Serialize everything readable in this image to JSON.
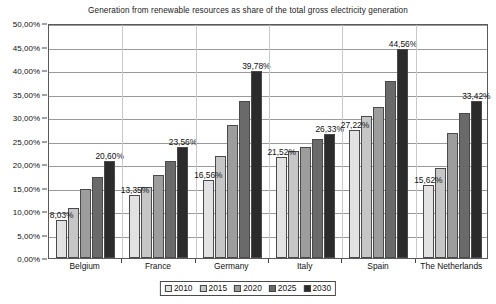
{
  "chart_data": {
    "type": "bar",
    "title": "Generation from renewable resources as share of the total gross electricity generation",
    "xlabel": "",
    "ylabel": "",
    "ylim": [
      0,
      50
    ],
    "ytick_step": 5,
    "grid": true,
    "legend_position": "bottom",
    "value_suffix": "%",
    "decimal_separator": ",",
    "categories": [
      "Belgium",
      "France",
      "Germany",
      "Italy",
      "Spain",
      "The Netherlands"
    ],
    "ytick_labels": [
      "0,00%",
      "5,00%",
      "10,00%",
      "15,00%",
      "20,00%",
      "25,00%",
      "30,00%",
      "35,00%",
      "40,00%",
      "45,00%",
      "50,00%"
    ],
    "ytick_values": [
      0,
      5,
      10,
      15,
      20,
      25,
      30,
      35,
      40,
      45,
      50
    ],
    "series": [
      {
        "name": "2010",
        "color": "#e2e2e2",
        "values": [
          8.03,
          13.35,
          16.56,
          21.52,
          27.22,
          15.62
        ]
      },
      {
        "name": "2015",
        "color": "#c6c6c6",
        "values": [
          10.6,
          15.1,
          21.8,
          22.7,
          30.3,
          19.1
        ]
      },
      {
        "name": "2020",
        "color": "#9d9d9d",
        "values": [
          14.7,
          17.7,
          28.3,
          23.6,
          32.1,
          26.6
        ]
      },
      {
        "name": "2025",
        "color": "#6a6a6a",
        "values": [
          17.2,
          20.6,
          33.5,
          25.3,
          37.6,
          30.9
        ]
      },
      {
        "name": "2030",
        "color": "#2b2b2b",
        "values": [
          20.6,
          23.56,
          39.78,
          26.33,
          44.56,
          33.42
        ]
      }
    ],
    "annotations": [
      {
        "category": "Belgium",
        "series": "2010",
        "text": "8,03%"
      },
      {
        "category": "Belgium",
        "series": "2030",
        "text": "20,60%"
      },
      {
        "category": "France",
        "series": "2010",
        "text": "13,35%"
      },
      {
        "category": "France",
        "series": "2030",
        "text": "23,56%"
      },
      {
        "category": "Germany",
        "series": "2010",
        "text": "16,56%"
      },
      {
        "category": "Germany",
        "series": "2030",
        "text": "39,78%"
      },
      {
        "category": "Italy",
        "series": "2010",
        "text": "21,52%"
      },
      {
        "category": "Italy",
        "series": "2030",
        "text": "26,33%"
      },
      {
        "category": "Spain",
        "series": "2010",
        "text": "27,22%"
      },
      {
        "category": "Spain",
        "series": "2030",
        "text": "44,56%"
      },
      {
        "category": "The Netherlands",
        "series": "2010",
        "text": "15,62%"
      },
      {
        "category": "The Netherlands",
        "series": "2030",
        "text": "33,42%"
      }
    ]
  }
}
